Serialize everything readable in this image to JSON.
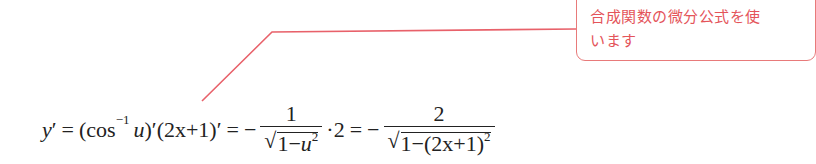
{
  "callout": {
    "text": "合成関数の微分公式を使います",
    "line1": "合成関数の微分公式を使",
    "line2": "います",
    "color": "#e4545a"
  },
  "formula": {
    "lhs": "y",
    "prime": "′",
    "eq": "=",
    "open": "(cos",
    "inv_exp": "−1",
    "u": "u",
    "close_prime": ")′",
    "factor": "(2x+1)′",
    "minus": "−",
    "frac1_num": "1",
    "frac1_den_const": "1−",
    "frac1_den_var": "u",
    "sq": "2",
    "times": "·2",
    "frac2_num": "2",
    "frac2_den": "1−(2x+1)",
    "latex": "y' = (\\cos^{-1} u)'(2x+1)' = -\\frac{1}{\\sqrt{1-u^2}}\\cdot 2 = -\\frac{2}{\\sqrt{1-(2x+1)^2}}"
  }
}
